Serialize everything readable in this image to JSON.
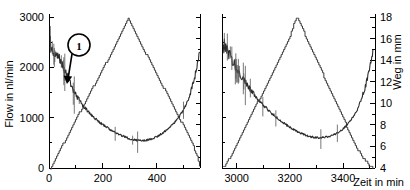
{
  "chart_data": {
    "type": "line",
    "title": "",
    "xlabel": "Zeit in min",
    "ylabel": "Flow in nl/min",
    "y2label": "Weg in mm",
    "grid": false,
    "legend": "none",
    "broken_axis": true,
    "panels": [
      {
        "name": "left-panel",
        "xlim": [
          0,
          560
        ],
        "xticks": [
          0,
          200,
          400
        ],
        "xticklabels": [
          "0",
          "200",
          "400"
        ],
        "xminorticks": [
          100,
          300,
          500
        ]
      },
      {
        "name": "right-panel",
        "xlim": [
          2945,
          3520
        ],
        "xticks": [
          3000,
          3200,
          3400
        ],
        "xticklabels": [
          "3000",
          "3200",
          "3400"
        ],
        "xminorticks": [
          3100,
          3300,
          3500
        ]
      }
    ],
    "ylim": [
      0,
      3000
    ],
    "yticks": [
      0,
      1000,
      2000,
      3000
    ],
    "yticklabels": [
      "0",
      "1000",
      "2000",
      "3000"
    ],
    "yminorticks": [
      500,
      1500,
      2500
    ],
    "y2lim": [
      4,
      18
    ],
    "y2ticks": [
      4,
      6,
      8,
      10,
      12,
      14,
      16,
      18
    ],
    "y2ticklabels": [
      "4",
      "6",
      "8",
      "10",
      "12",
      "14",
      "16",
      "18"
    ],
    "y2minorticks": [
      5,
      7,
      9,
      11,
      13,
      15,
      17
    ],
    "series": [
      {
        "name": "Flow",
        "axis": "left",
        "unit": "nl/min",
        "style": "noisy-line",
        "color": "#2b2b2b",
        "panel_left": {
          "x": [
            5,
            12,
            18,
            24,
            30,
            36,
            42,
            48,
            55,
            62,
            70,
            78,
            86,
            95,
            105,
            115,
            125,
            135,
            145,
            158,
            170,
            182,
            195,
            210,
            225,
            240,
            255,
            270,
            285,
            300,
            315,
            330,
            345,
            360,
            375,
            390,
            405,
            420,
            435,
            450,
            465,
            480,
            495,
            510,
            525,
            540,
            552,
            558
          ],
          "y": [
            2450,
            2380,
            2340,
            2300,
            2250,
            2190,
            2120,
            2050,
            1980,
            1900,
            1800,
            1700,
            1600,
            1500,
            1400,
            1320,
            1250,
            1180,
            1120,
            1050,
            990,
            930,
            880,
            820,
            770,
            720,
            680,
            640,
            610,
            580,
            560,
            550,
            545,
            550,
            570,
            600,
            640,
            690,
            750,
            820,
            900,
            1000,
            1120,
            1280,
            1500,
            1800,
            2100,
            2300
          ]
        },
        "panel_right": {
          "x": [
            2950,
            2958,
            2966,
            2974,
            2982,
            2992,
            3002,
            3014,
            3026,
            3038,
            3052,
            3066,
            3080,
            3095,
            3110,
            3125,
            3140,
            3155,
            3170,
            3185,
            3200,
            3215,
            3230,
            3245,
            3260,
            3275,
            3290,
            3305,
            3320,
            3335,
            3350,
            3365,
            3380,
            3395,
            3410,
            3425,
            3440,
            3455,
            3470,
            3485,
            3500,
            3512
          ],
          "y": [
            2450,
            2380,
            2300,
            2220,
            2140,
            2050,
            1960,
            1860,
            1760,
            1660,
            1560,
            1460,
            1370,
            1280,
            1200,
            1120,
            1050,
            980,
            920,
            860,
            810,
            760,
            720,
            680,
            650,
            625,
            610,
            600,
            600,
            610,
            630,
            660,
            700,
            760,
            830,
            920,
            1030,
            1180,
            1380,
            1650,
            2000,
            2300
          ]
        }
      },
      {
        "name": "Weg",
        "axis": "right",
        "unit": "mm",
        "style": "staircase-triangle",
        "color": "#3a3a3a",
        "panel_left": {
          "x": [
            5,
            30,
            60,
            90,
            120,
            150,
            180,
            210,
            240,
            270,
            292,
            300,
            320,
            350,
            380,
            410,
            440,
            470,
            500,
            530,
            552,
            558
          ],
          "y": [
            4.0,
            5.2,
            6.6,
            8.0,
            9.5,
            10.9,
            12.3,
            13.7,
            15.1,
            16.6,
            17.9,
            17.6,
            16.5,
            15.0,
            13.6,
            12.1,
            10.7,
            9.2,
            7.8,
            6.3,
            4.9,
            4.2
          ]
        },
        "panel_right": {
          "x": [
            2950,
            2970,
            2995,
            3020,
            3045,
            3070,
            3095,
            3120,
            3145,
            3170,
            3195,
            3218,
            3228,
            3250,
            3275,
            3300,
            3325,
            3350,
            3375,
            3400,
            3425,
            3450,
            3475,
            3500,
            3512
          ],
          "y": [
            4.1,
            4.8,
            6.0,
            7.2,
            8.5,
            9.7,
            10.9,
            12.1,
            13.4,
            14.6,
            15.8,
            17.6,
            17.9,
            16.7,
            15.3,
            14.0,
            12.6,
            11.3,
            9.9,
            8.6,
            7.2,
            5.9,
            4.9,
            4.2,
            4.0
          ]
        }
      }
    ],
    "annotations": [
      {
        "label": "1",
        "type": "circled-callout",
        "target_series": "Flow",
        "target_x": 62,
        "target_y": 1900,
        "description": "Circled marker 1 with leader arrow pointing to the initial steep flow drop"
      }
    ]
  },
  "axes": {
    "x_title": "Zeit in min",
    "y_left_title": "Flow in nl/min",
    "y_right_title": "Weg in mm"
  }
}
